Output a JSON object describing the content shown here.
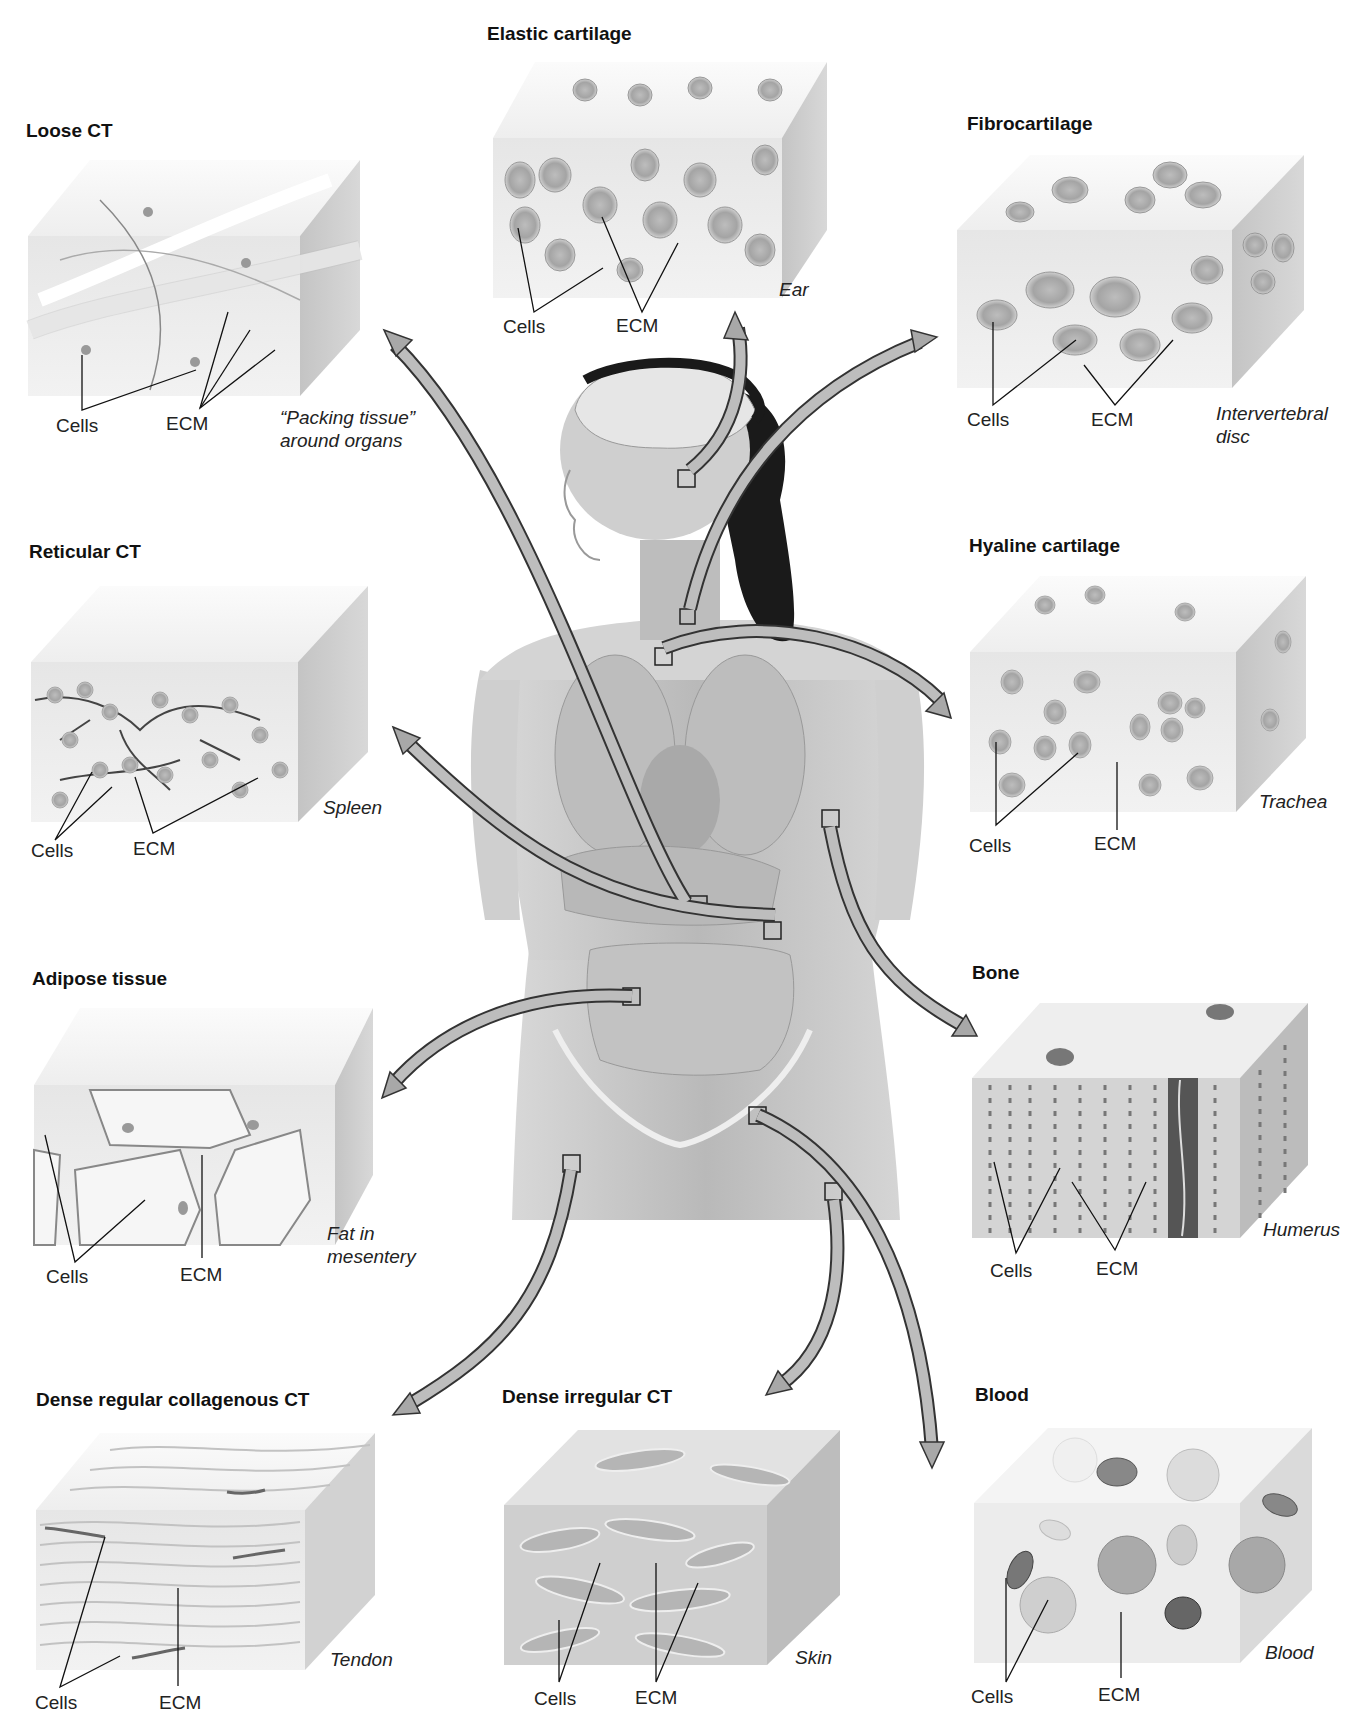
{
  "figure": {
    "center_label": "human-figure-with-connective-tissue-locations",
    "panels": [
      {
        "id": "loose-ct",
        "title": "Loose CT",
        "cells_label": "Cells",
        "ecm_label": "ECM",
        "location": "“Packing tissue” around organs"
      },
      {
        "id": "elastic-cartilage",
        "title": "Elastic cartilage",
        "cells_label": "Cells",
        "ecm_label": "ECM",
        "location": "Ear"
      },
      {
        "id": "fibrocartilage",
        "title": "Fibrocartilage",
        "cells_label": "Cells",
        "ecm_label": "ECM",
        "location": "Intervertebral disc"
      },
      {
        "id": "reticular-ct",
        "title": "Reticular CT",
        "cells_label": "Cells",
        "ecm_label": "ECM",
        "location": "Spleen"
      },
      {
        "id": "hyaline-cartilage",
        "title": "Hyaline cartilage",
        "cells_label": "Cells",
        "ecm_label": "ECM",
        "location": "Trachea"
      },
      {
        "id": "adipose-tissue",
        "title": "Adipose tissue",
        "cells_label": "Cells",
        "ecm_label": "ECM",
        "location": "Fat in mesentery"
      },
      {
        "id": "bone",
        "title": "Bone",
        "cells_label": "Cells",
        "ecm_label": "ECM",
        "location": "Humerus"
      },
      {
        "id": "dense-regular-ct",
        "title": "Dense regular collagenous CT",
        "cells_label": "Cells",
        "ecm_label": "ECM",
        "location": "Tendon"
      },
      {
        "id": "dense-irregular-ct",
        "title": "Dense irregular CT",
        "cells_label": "Cells",
        "ecm_label": "ECM",
        "location": "Skin"
      },
      {
        "id": "blood",
        "title": "Blood",
        "cells_label": "Cells",
        "ecm_label": "ECM",
        "location": "Blood"
      }
    ]
  },
  "colors": {
    "arrow_fill": "#a8a8a8",
    "arrow_stroke": "#333333",
    "block_front": "#e4e4e4",
    "block_top": "#f2f2f2",
    "block_side": "#c9c9c9",
    "hair": "#1a1a1a",
    "body": "#c8c8c8"
  }
}
